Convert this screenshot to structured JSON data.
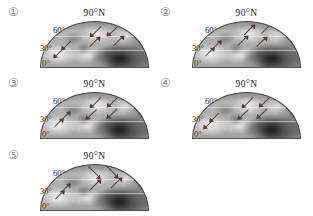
{
  "figure": {
    "description_labels": {
      "pole_label": "90°N",
      "latitude_labels": [
        "60°",
        "30°",
        "0°"
      ]
    },
    "colors": {
      "arrow": "#5f3a2c",
      "label_text": "#222222",
      "panel_number": "#8a8a8a",
      "globe_outline": "#4a4a4a"
    },
    "panels": [
      {
        "number": "①",
        "arrows": [
          {
            "x": 46,
            "y": 18,
            "rot": 135,
            "len": 13
          },
          {
            "x": 62,
            "y": 15,
            "rot": 135,
            "len": 14
          },
          {
            "x": 44,
            "y": 44,
            "rot": -45,
            "len": 12
          },
          {
            "x": 66,
            "y": 42,
            "rot": -45,
            "len": 12
          },
          {
            "x": 20,
            "y": 48,
            "rot": 135,
            "len": 10
          },
          {
            "x": 12,
            "y": 66,
            "rot": 135,
            "len": 10
          }
        ]
      },
      {
        "number": "②",
        "arrows": [
          {
            "x": 46,
            "y": 18,
            "rot": -45,
            "len": 13
          },
          {
            "x": 62,
            "y": 14,
            "rot": -45,
            "len": 15
          },
          {
            "x": 40,
            "y": 42,
            "rot": -45,
            "len": 12
          },
          {
            "x": 58,
            "y": 44,
            "rot": -45,
            "len": 12
          },
          {
            "x": 17,
            "y": 50,
            "rot": -45,
            "len": 10
          },
          {
            "x": 10,
            "y": 66,
            "rot": -45,
            "len": 10
          }
        ]
      },
      {
        "number": "③",
        "arrows": [
          {
            "x": 46,
            "y": 18,
            "rot": 135,
            "len": 13
          },
          {
            "x": 62,
            "y": 15,
            "rot": 135,
            "len": 14
          },
          {
            "x": 42,
            "y": 44,
            "rot": 135,
            "len": 12
          },
          {
            "x": 62,
            "y": 42,
            "rot": 135,
            "len": 12
          },
          {
            "x": 18,
            "y": 50,
            "rot": -45,
            "len": 10
          },
          {
            "x": 11,
            "y": 66,
            "rot": -45,
            "len": 10
          }
        ]
      },
      {
        "number": "④",
        "arrows": [
          {
            "x": 46,
            "y": 18,
            "rot": 135,
            "len": 13
          },
          {
            "x": 62,
            "y": 15,
            "rot": 135,
            "len": 14
          },
          {
            "x": 42,
            "y": 44,
            "rot": 135,
            "len": 12
          },
          {
            "x": 60,
            "y": 42,
            "rot": 135,
            "len": 12
          },
          {
            "x": 16,
            "y": 50,
            "rot": 135,
            "len": 10
          },
          {
            "x": 10,
            "y": 66,
            "rot": 135,
            "len": 10
          }
        ]
      },
      {
        "number": "⑤",
        "arrows": [
          {
            "x": 42,
            "y": 14,
            "rot": 45,
            "len": 15
          },
          {
            "x": 58,
            "y": 12,
            "rot": 45,
            "len": 16
          },
          {
            "x": 44,
            "y": 44,
            "rot": -45,
            "len": 13
          },
          {
            "x": 64,
            "y": 40,
            "rot": -45,
            "len": 13
          },
          {
            "x": 18,
            "y": 50,
            "rot": -45,
            "len": 10
          },
          {
            "x": 12,
            "y": 66,
            "rot": -45,
            "len": 10
          }
        ]
      }
    ]
  }
}
